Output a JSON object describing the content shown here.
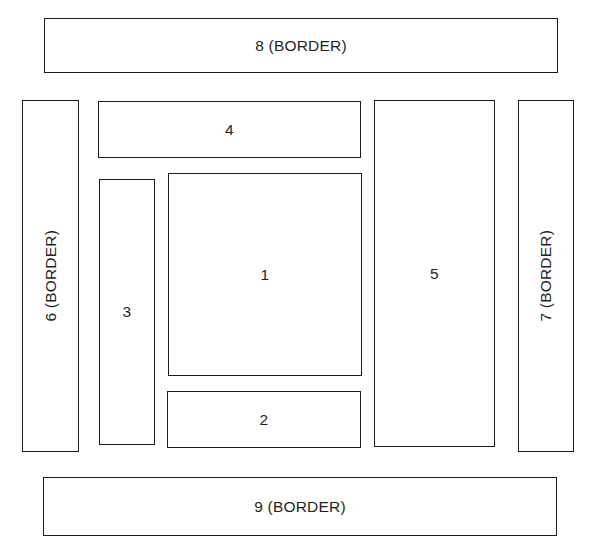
{
  "diagram": {
    "type": "zone-layout-plan",
    "background_color": "#ffffff",
    "line_color": "#1a1a1a",
    "text_color": "#1f1f1f",
    "zones": [
      {
        "id": "zone-1",
        "label": "1",
        "number": "1",
        "orientation": "horizontal",
        "region": "interior"
      },
      {
        "id": "zone-2",
        "label": "2",
        "number": "2",
        "orientation": "horizontal",
        "region": "interior"
      },
      {
        "id": "zone-3",
        "label": "3",
        "number": "3",
        "orientation": "horizontal",
        "region": "interior"
      },
      {
        "id": "zone-4",
        "label": "4",
        "number": "4",
        "orientation": "horizontal",
        "region": "interior"
      },
      {
        "id": "zone-5",
        "label": "5",
        "number": "5",
        "orientation": "horizontal",
        "region": "interior"
      },
      {
        "id": "zone-6",
        "label": "6 (BORDER)",
        "number": "6",
        "orientation": "vertical",
        "region": "border"
      },
      {
        "id": "zone-7",
        "label": "7 (BORDER)",
        "number": "7",
        "orientation": "vertical",
        "region": "border"
      },
      {
        "id": "zone-8",
        "label": "8 (BORDER)",
        "number": "8",
        "orientation": "horizontal",
        "region": "border"
      },
      {
        "id": "zone-9",
        "label": "9 (BORDER)",
        "number": "9",
        "orientation": "horizontal",
        "region": "border"
      }
    ]
  }
}
